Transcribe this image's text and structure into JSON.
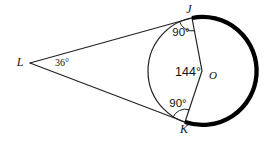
{
  "figure": {
    "type": "geometry-diagram",
    "background": "#ffffff",
    "thin_stroke_color": "#222222",
    "thick_arc_color": "#000000",
    "labels": {
      "L": "L",
      "J": "J",
      "K": "K",
      "O": "O"
    },
    "angles": {
      "at_L": "36°",
      "at_J": "90°",
      "at_K": "90°",
      "at_O": "144°"
    }
  }
}
